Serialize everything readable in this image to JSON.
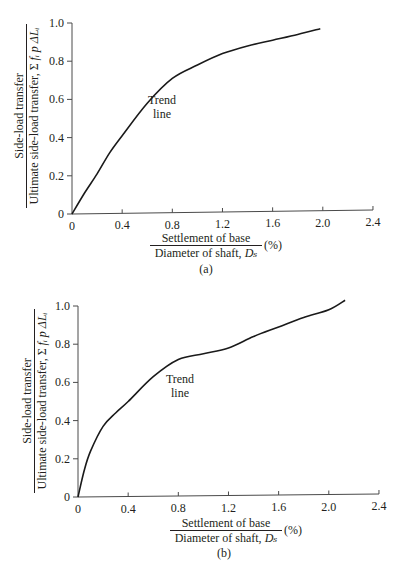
{
  "panels": [
    {
      "id": "a",
      "caption": "(a)",
      "annotation_line1": "Trend",
      "annotation_line2": "line",
      "ylabel_numerator": "Side-load transfer",
      "ylabel_denominator_prefix": "Ultimate side-load transfer, Σ ",
      "ylabel_denominator_vars": "fᵢ p ΔLᵢ",
      "xlabel_numerator": "Settlement of base",
      "xlabel_denominator_prefix": "Diameter of shaft, ",
      "xlabel_denominator_var": "Dₛ",
      "xlabel_unit": "(%)",
      "xticks": [
        "0",
        "0.4",
        "0.8",
        "1.2",
        "1.6",
        "2.0",
        "2.4"
      ],
      "yticks": [
        "0",
        "0.2",
        "0.4",
        "0.6",
        "0.8",
        "1.0"
      ]
    },
    {
      "id": "b",
      "caption": "(b)",
      "annotation_line1": "Trend",
      "annotation_line2": "line",
      "ylabel_numerator": "Side-load transfer",
      "ylabel_denominator_prefix": "Ultimate side-load transfer, Σ ",
      "ylabel_denominator_vars": "fᵢ p ΔLᵢ",
      "xlabel_numerator": "Settlement of base",
      "xlabel_denominator_prefix": "Diameter of shaft, ",
      "xlabel_denominator_var": "Dₛ",
      "xlabel_unit": "(%)",
      "xticks": [
        "0",
        "0.4",
        "0.8",
        "1.2",
        "1.6",
        "2.0",
        "2.4"
      ],
      "yticks": [
        "0",
        "0.2",
        "0.4",
        "0.6",
        "0.8",
        "1.0"
      ]
    }
  ],
  "chart_data": [
    {
      "type": "line",
      "title": "(a)",
      "xlabel": "Settlement of base / Diameter of shaft, Ds (%)",
      "ylabel": "Side-load transfer / Ultimate side-load transfer, Σ fi p ΔLi",
      "xlim": [
        0,
        2.4
      ],
      "ylim": [
        0,
        1.0
      ],
      "xticks": [
        0,
        0.4,
        0.8,
        1.2,
        1.6,
        2.0,
        2.4
      ],
      "yticks": [
        0,
        0.2,
        0.4,
        0.6,
        0.8,
        1.0
      ],
      "grid": false,
      "annotations": [
        {
          "text": "Trend line",
          "x": 0.95,
          "y": 0.6
        }
      ],
      "series": [
        {
          "name": "Trend line",
          "x": [
            0,
            0.1,
            0.2,
            0.3,
            0.4,
            0.6,
            0.8,
            1.0,
            1.2,
            1.4,
            1.6,
            1.8,
            1.98
          ],
          "y": [
            0,
            0.11,
            0.21,
            0.32,
            0.41,
            0.58,
            0.71,
            0.78,
            0.84,
            0.88,
            0.91,
            0.94,
            0.97
          ]
        }
      ]
    },
    {
      "type": "line",
      "title": "(b)",
      "xlabel": "Settlement of base / Diameter of shaft, Ds (%)",
      "ylabel": "Side-load transfer / Ultimate side-load transfer, Σ fi p ΔLi",
      "xlim": [
        0,
        2.4
      ],
      "ylim": [
        0,
        1.0
      ],
      "xticks": [
        0,
        0.4,
        0.8,
        1.2,
        1.6,
        2.0,
        2.4
      ],
      "yticks": [
        0,
        0.2,
        0.4,
        0.6,
        0.8,
        1.0
      ],
      "grid": false,
      "annotations": [
        {
          "text": "Trend line",
          "x": 0.95,
          "y": 0.62
        }
      ],
      "series": [
        {
          "name": "Trend line",
          "x": [
            0,
            0.05,
            0.1,
            0.2,
            0.3,
            0.4,
            0.6,
            0.8,
            1.0,
            1.2,
            1.4,
            1.6,
            1.8,
            2.0,
            2.13
          ],
          "y": [
            0,
            0.14,
            0.24,
            0.37,
            0.44,
            0.5,
            0.63,
            0.72,
            0.75,
            0.78,
            0.84,
            0.89,
            0.94,
            0.98,
            1.03
          ]
        }
      ]
    }
  ]
}
